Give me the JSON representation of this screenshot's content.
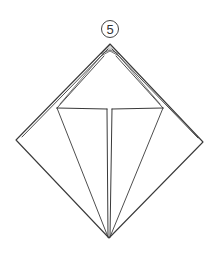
{
  "diagram": {
    "type": "origami-instruction",
    "step_number": "5",
    "colors": {
      "line": "#3a3a3a",
      "background": "#ffffff",
      "fill_accent": "#d6d6d6"
    }
  }
}
